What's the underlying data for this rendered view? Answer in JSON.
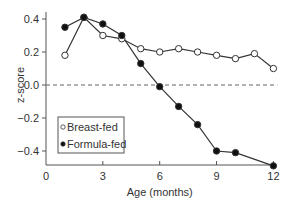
{
  "chart_data": {
    "type": "line",
    "title": "",
    "xlabel": "Age (months)",
    "ylabel": "z-score",
    "xlim": [
      0,
      12
    ],
    "ylim": [
      -0.5,
      0.45
    ],
    "x_ticks": [
      0,
      3,
      6,
      9,
      12
    ],
    "y_ticks": [
      -0.4,
      -0.2,
      0.0,
      0.2,
      0.4
    ],
    "y_tick_labels": [
      "−0.4",
      "−0.2",
      "0.0",
      "0.2",
      "0.4"
    ],
    "grid": false,
    "reference_line": {
      "y": 0.0,
      "style": "dashed"
    },
    "legend": {
      "position": "lower-left",
      "entries": [
        "Breast-fed",
        "Formula-fed"
      ]
    },
    "series": [
      {
        "name": "Breast-fed",
        "marker": "open-circle",
        "x": [
          1,
          2,
          3,
          4,
          5,
          6,
          7,
          8,
          9,
          10,
          11,
          12
        ],
        "values": [
          0.18,
          0.41,
          0.3,
          0.28,
          0.22,
          0.2,
          0.22,
          0.2,
          0.18,
          0.16,
          0.19,
          0.1
        ]
      },
      {
        "name": "Formula-fed",
        "marker": "filled-circle",
        "x": [
          1,
          2,
          3,
          4,
          5,
          6,
          7,
          8,
          9,
          10,
          12
        ],
        "values": [
          0.35,
          0.41,
          0.37,
          0.3,
          0.13,
          -0.01,
          -0.13,
          -0.24,
          -0.4,
          -0.41,
          -0.49
        ]
      }
    ]
  }
}
